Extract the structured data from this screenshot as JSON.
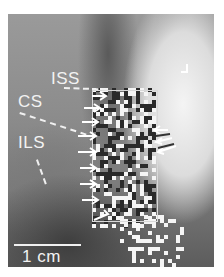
{
  "figure": {
    "labels": {
      "iss": "ISS",
      "cs": "CS",
      "ils": "ILS"
    },
    "scale_bar": {
      "label": "1 cm"
    },
    "colors": {
      "label": "#f2f2f2",
      "arrow": "#ffffff",
      "dark_cell": "#2a2a2a",
      "light_cell": "#f5f5f5"
    },
    "overlay": {
      "grid_region": {
        "x": 92,
        "y": 88,
        "w": 64,
        "h": 140
      },
      "lower_region": {
        "x": 120,
        "y": 215,
        "w": 64,
        "h": 52
      },
      "arrow_count_left": 9,
      "arrow_count_right": 3
    }
  }
}
